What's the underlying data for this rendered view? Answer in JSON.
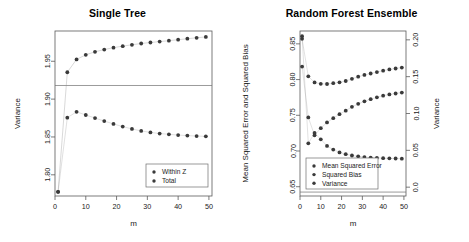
{
  "chart_data": [
    {
      "type": "scatter",
      "panel": "left",
      "title": "Single Tree",
      "xlabel": "m",
      "ylabel": "Variance",
      "xlim": [
        0,
        51
      ],
      "ylim": [
        1.772,
        1.99
      ],
      "xticks": [
        0,
        10,
        20,
        30,
        40,
        50
      ],
      "yticks": [
        1.8,
        1.85,
        1.9,
        1.95
      ],
      "ytick_labels": [
        "1.80",
        "1.85",
        "1.90",
        "1.95"
      ],
      "xtick_labels": [
        "0",
        "10",
        "20",
        "30",
        "40",
        "50"
      ],
      "grid": false,
      "legend_position": "bottom-right",
      "reference_line_y": 1.918,
      "x": [
        1,
        4,
        7,
        10,
        13,
        16,
        19,
        22,
        25,
        28,
        31,
        34,
        37,
        40,
        43,
        46,
        49
      ],
      "series": [
        {
          "name": "Within Z",
          "values": [
            1.7775,
            1.8755,
            1.8832,
            1.879,
            1.875,
            1.871,
            1.8672,
            1.8637,
            1.8606,
            1.858,
            1.856,
            1.8545,
            1.8535,
            1.8525,
            1.8518,
            1.8512,
            1.8508
          ]
        },
        {
          "name": "Total",
          "values": [
            1.7775,
            1.9355,
            1.9525,
            1.9585,
            1.9625,
            1.9655,
            1.968,
            1.97,
            1.9718,
            1.9735,
            1.9748,
            1.976,
            1.9772,
            1.9785,
            1.9798,
            1.981,
            1.9822
          ]
        }
      ]
    },
    {
      "type": "scatter",
      "panel": "right",
      "title": "Random Forest Ensemble",
      "xlabel": "m",
      "ylabel_left": "Mean Squared Error and Squared Bias",
      "ylabel_right": "Variance",
      "xlim": [
        0,
        51
      ],
      "ylim_left": [
        0.637,
        0.868
      ],
      "ylim_right": [
        -0.012,
        0.212
      ],
      "xticks": [
        0,
        10,
        20,
        30,
        40,
        50
      ],
      "yticks_left": [
        0.65,
        0.7,
        0.75,
        0.8,
        0.85
      ],
      "ytick_labels_left": [
        "0.65",
        "0.70",
        "0.75",
        "0.80",
        "0.85"
      ],
      "yticks_right": [
        0.0,
        0.05,
        0.1,
        0.15,
        0.2
      ],
      "ytick_labels_right": [
        "0.0",
        "0.05",
        "0.10",
        "0.15",
        "0.20"
      ],
      "xtick_labels": [
        "0",
        "10",
        "20",
        "30",
        "40",
        "50"
      ],
      "grid": false,
      "legend_position": "bottom-left",
      "reference_line_y_left": 0.6425,
      "x": [
        1,
        4,
        7,
        10,
        13,
        16,
        19,
        22,
        25,
        28,
        31,
        34,
        37,
        40,
        43,
        46,
        49
      ],
      "series": [
        {
          "name": "Mean Squared Error",
          "axis": "left",
          "values": [
            0.857,
            0.8045,
            0.796,
            0.794,
            0.7938,
            0.795,
            0.7962,
            0.798,
            0.801,
            0.804,
            0.8065,
            0.8085,
            0.8105,
            0.8125,
            0.8142,
            0.8155,
            0.8168
          ]
        },
        {
          "name": "Squared Bias",
          "axis": "left",
          "values": [
            0.8182,
            0.747,
            0.722,
            0.732,
            0.74,
            0.746,
            0.7515,
            0.7565,
            0.7618,
            0.766,
            0.7695,
            0.7725,
            0.7752,
            0.7775,
            0.7792,
            0.7805,
            0.7818
          ]
        },
        {
          "name": "Variance",
          "axis": "right",
          "values": [
            0.205,
            0.0595,
            0.0735,
            0.065,
            0.056,
            0.051,
            0.0472,
            0.0448,
            0.043,
            0.0418,
            0.0408,
            0.0402,
            0.0398,
            0.0394,
            0.0391,
            0.0389,
            0.0387
          ]
        }
      ]
    }
  ],
  "left_panel": {
    "title": "Single Tree",
    "xlabel": "m",
    "ylabel": "Variance",
    "legend": [
      {
        "label": "Within Z"
      },
      {
        "label": "Total"
      }
    ]
  },
  "right_panel": {
    "title": "Random Forest Ensemble",
    "xlabel": "m",
    "ylabel_left": "Mean Squared Error and Squared Bias",
    "ylabel_right": "Variance",
    "legend": [
      {
        "label": "Mean Squared Error"
      },
      {
        "label": "Squared Bias"
      },
      {
        "label": "Variance"
      }
    ]
  },
  "colors": {
    "point": "#3a3a3a",
    "axis": "#5a5a5a",
    "text": "#1a1a1a",
    "background": "#ffffff"
  }
}
